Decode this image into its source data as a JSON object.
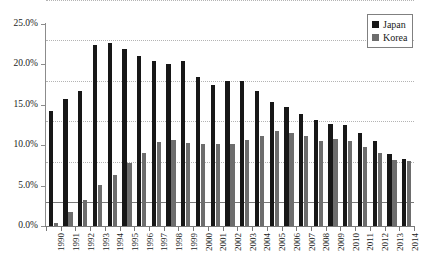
{
  "chart_data": {
    "type": "bar",
    "title": "",
    "subtitle": "",
    "xlabel": "",
    "ylabel": "",
    "ylim": [
      0,
      25
    ],
    "ytick_labels": [
      "0.0%",
      "5.0%",
      "10.0%",
      "15.0%",
      "20.0%",
      "25.0%"
    ],
    "ytick_values": [
      0,
      5,
      10,
      15,
      20,
      25
    ],
    "grid": true,
    "grid_style": "dotted-horizontal",
    "legend_position": "top-right",
    "value_unit": "percent",
    "categories": [
      "1990",
      "1991",
      "1992",
      "1993",
      "1994",
      "1995",
      "1996",
      "1997",
      "1998",
      "1999",
      "2000",
      "2001",
      "2002",
      "2003",
      "2004",
      "2005",
      "2006",
      "2007",
      "2008",
      "2009",
      "2010",
      "2011",
      "2012",
      "2013",
      "2014"
    ],
    "series": [
      {
        "name": "Japan",
        "color": "#171717",
        "values": [
          14.2,
          15.7,
          16.7,
          22.4,
          22.7,
          21.9,
          21.0,
          20.4,
          20.1,
          20.4,
          18.4,
          17.5,
          17.9,
          17.9,
          16.7,
          15.4,
          14.7,
          13.9,
          13.1,
          12.6,
          12.5,
          11.5,
          10.5,
          8.9,
          8.3
        ]
      },
      {
        "name": "Korea",
        "color": "#6d6d6d",
        "values": [
          0.4,
          1.7,
          3.2,
          5.1,
          6.3,
          7.8,
          9.0,
          10.4,
          10.6,
          10.3,
          10.2,
          10.1,
          10.2,
          10.7,
          11.2,
          11.7,
          11.5,
          11.2,
          10.5,
          10.8,
          10.5,
          9.8,
          9.0,
          8.2,
          8.0
        ]
      }
    ]
  },
  "legend": {
    "items": [
      {
        "label": "Japan",
        "swatch": "japan"
      },
      {
        "label": "Korea",
        "swatch": "korea"
      }
    ]
  }
}
